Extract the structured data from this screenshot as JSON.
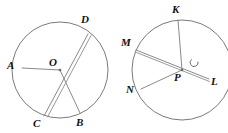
{
  "figure": {
    "background_color": "#ffffff",
    "stroke_color": "#8a8a8a",
    "label_color": "#111111",
    "width": 228,
    "height": 133
  },
  "circles": [
    {
      "id": "left-circle",
      "center_label": "O",
      "center_x": 60,
      "center_y": 70,
      "radius": 48,
      "center_label_x": 49,
      "center_label_y": 57,
      "points": [
        {
          "label": "A",
          "x": 22,
          "y": 68,
          "label_x": 7,
          "label_y": 60,
          "type": "radius-endpoint"
        },
        {
          "label": "D",
          "x": 88,
          "y": 34,
          "label_x": 81,
          "label_y": 14,
          "type": "diameter-endpoint"
        },
        {
          "label": "B",
          "x": 80,
          "y": 113,
          "label_x": 76,
          "label_y": 117,
          "type": "radius-endpoint"
        },
        {
          "label": "C",
          "x": 44,
          "y": 116,
          "label_x": 33,
          "label_y": 118,
          "type": "diameter-endpoint"
        }
      ],
      "segments": [
        {
          "name": "radius-OA",
          "from": "O",
          "to": "A",
          "style": "single"
        },
        {
          "name": "radius-OB",
          "from": "O",
          "to": "B",
          "style": "single"
        },
        {
          "name": "diameter-CD",
          "from": "C",
          "to": "D",
          "style": "double"
        }
      ]
    },
    {
      "id": "right-circle",
      "center_label": "P",
      "center_x": 182,
      "center_y": 70,
      "radius": 50,
      "center_label_x": 174,
      "center_label_y": 72,
      "points": [
        {
          "label": "K",
          "x": 178,
          "y": 20,
          "label_x": 172,
          "label_y": 4,
          "type": "radius-endpoint"
        },
        {
          "label": "L",
          "x": 209,
          "y": 79,
          "label_x": 211,
          "label_y": 76,
          "type": "diameter-endpoint"
        },
        {
          "label": "N",
          "x": 141,
          "y": 89,
          "label_x": 126,
          "label_y": 84,
          "type": "radius-endpoint"
        },
        {
          "label": "M",
          "x": 136,
          "y": 50,
          "label_x": 121,
          "label_y": 37,
          "type": "diameter-endpoint"
        }
      ],
      "segments": [
        {
          "name": "radius-PK",
          "from": "P",
          "to": "K",
          "style": "single"
        },
        {
          "name": "radius-PN",
          "from": "P",
          "to": "N",
          "style": "single"
        },
        {
          "name": "diameter-ML",
          "from": "M",
          "to": "L",
          "style": "double"
        }
      ],
      "angle_mark": {
        "name": "angle-KPL-mark",
        "center_x": 195,
        "center_y": 59,
        "radius": 4,
        "description": "small arc marking angle at P between PK and PL"
      }
    }
  ]
}
